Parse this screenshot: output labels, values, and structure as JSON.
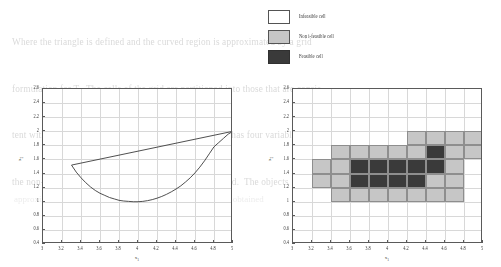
{
  "page": {
    "background_color": "#ffffff",
    "bleed_through_lines": [
      "Where the triangle is defined and the curved region is approximated by a grid",
      "formulation for T.  The cells of the grid are partitioned into those that are consis-",
      "tent with their neighbours in the radial scale.  The graph has four variables,",
      "the non-basic elements of the deformity region introduced.  The objects"
    ],
    "bleed_through_lower": "approximation cells and the feasible region of the relaxation obtained"
  },
  "legend": {
    "name": "cell-type-legend",
    "entries": [
      {
        "label": "Infeasible cell",
        "swatch_color": "#ffffff",
        "border_color": "#545454"
      },
      {
        "label": "Non i-feasible cell",
        "swatch_color": "#c6c6c6",
        "border_color": "#545454"
      },
      {
        "label": "Feasible cell",
        "swatch_color": "#3a3a3a",
        "border_color": "#303030"
      }
    ]
  },
  "chart_data": [
    {
      "id": "left",
      "type": "line",
      "title": "",
      "xlabel": "x₁",
      "ylabel": "x₂",
      "xlim": [
        3,
        5
      ],
      "ylim": [
        0.4,
        2.6
      ],
      "xticks": [
        "3",
        "3.2",
        "3.4",
        "3.6",
        "3.8",
        "4",
        "4.2",
        "4.4",
        "4.6",
        "4.8",
        "5"
      ],
      "xtick_values": [
        3,
        3.2,
        3.4,
        3.6,
        3.8,
        4,
        4.2,
        4.4,
        4.6,
        4.8,
        5
      ],
      "yticks": [
        "0.4",
        "0.6",
        "0.8",
        "1",
        "1.2",
        "1.4",
        "1.6",
        "1.8",
        "2",
        "2.2",
        "2.4",
        "2.6"
      ],
      "ytick_values": [
        0.4,
        0.6,
        0.8,
        1,
        1.2,
        1.4,
        1.6,
        1.8,
        2,
        2.2,
        2.4,
        2.6
      ],
      "grid": true,
      "legend_position": "none",
      "series": [
        {
          "name": "upper chord",
          "color": "#3c3c3c",
          "points": [
            [
              3.3,
              1.52
            ],
            [
              5.0,
              2.0
            ]
          ]
        },
        {
          "name": "lower parabola",
          "color": "#3c3c3c",
          "points": [
            [
              3.3,
              1.52
            ],
            [
              3.35,
              1.42
            ],
            [
              3.4,
              1.34
            ],
            [
              3.45,
              1.27
            ],
            [
              3.5,
              1.21
            ],
            [
              3.55,
              1.16
            ],
            [
              3.6,
              1.12
            ],
            [
              3.65,
              1.09
            ],
            [
              3.7,
              1.06
            ],
            [
              3.75,
              1.04
            ],
            [
              3.8,
              1.02
            ],
            [
              3.85,
              1.01
            ],
            [
              3.9,
              1.005
            ],
            [
              3.95,
              1.0
            ],
            [
              4.0,
              1.0
            ],
            [
              4.05,
              1.005
            ],
            [
              4.1,
              1.015
            ],
            [
              4.15,
              1.03
            ],
            [
              4.2,
              1.05
            ],
            [
              4.25,
              1.075
            ],
            [
              4.3,
              1.105
            ],
            [
              4.35,
              1.14
            ],
            [
              4.4,
              1.18
            ],
            [
              4.45,
              1.225
            ],
            [
              4.5,
              1.28
            ],
            [
              4.55,
              1.34
            ],
            [
              4.6,
              1.41
            ],
            [
              4.65,
              1.49
            ],
            [
              4.7,
              1.58
            ],
            [
              4.75,
              1.68
            ],
            [
              4.8,
              1.78
            ],
            [
              4.85,
              1.84
            ],
            [
              4.9,
              1.9
            ],
            [
              4.95,
              1.96
            ],
            [
              5.0,
              2.0
            ]
          ]
        }
      ]
    },
    {
      "id": "right",
      "type": "heatmap",
      "title": "",
      "xlabel": "x₁",
      "ylabel": "x₂",
      "xlim": [
        3,
        5
      ],
      "ylim": [
        0.4,
        2.6
      ],
      "xticks": [
        "3",
        "3.2",
        "3.4",
        "3.6",
        "3.8",
        "4",
        "4.2",
        "4.4",
        "4.6",
        "4.8",
        "5"
      ],
      "xtick_values": [
        3,
        3.2,
        3.4,
        3.6,
        3.8,
        4,
        4.2,
        4.4,
        4.6,
        4.8,
        5
      ],
      "yticks": [
        "0.4",
        "0.6",
        "0.8",
        "1",
        "1.2",
        "1.4",
        "1.6",
        "1.8",
        "2",
        "2.2",
        "2.4",
        "2.6"
      ],
      "ytick_values": [
        0.4,
        0.6,
        0.8,
        1,
        1.2,
        1.4,
        1.6,
        1.8,
        2,
        2.2,
        2.4,
        2.6
      ],
      "grid": true,
      "legend_position": "above",
      "cell_size": [
        0.2,
        0.2
      ],
      "colors": {
        "infeasible": "#ffffff",
        "non_i_feasible": "#c6c6c6",
        "feasible": "#3a3a3a"
      },
      "cells": [
        {
          "x": 4.2,
          "y": 1.8,
          "state": "non_i_feasible"
        },
        {
          "x": 4.4,
          "y": 1.8,
          "state": "non_i_feasible"
        },
        {
          "x": 4.6,
          "y": 1.8,
          "state": "non_i_feasible"
        },
        {
          "x": 4.8,
          "y": 1.8,
          "state": "non_i_feasible"
        },
        {
          "x": 3.4,
          "y": 1.6,
          "state": "non_i_feasible"
        },
        {
          "x": 3.6,
          "y": 1.6,
          "state": "non_i_feasible"
        },
        {
          "x": 3.8,
          "y": 1.6,
          "state": "non_i_feasible"
        },
        {
          "x": 4.0,
          "y": 1.6,
          "state": "non_i_feasible"
        },
        {
          "x": 4.2,
          "y": 1.6,
          "state": "non_i_feasible"
        },
        {
          "x": 4.4,
          "y": 1.6,
          "state": "feasible"
        },
        {
          "x": 4.6,
          "y": 1.6,
          "state": "non_i_feasible"
        },
        {
          "x": 4.8,
          "y": 1.6,
          "state": "non_i_feasible"
        },
        {
          "x": 3.2,
          "y": 1.4,
          "state": "non_i_feasible"
        },
        {
          "x": 3.4,
          "y": 1.4,
          "state": "non_i_feasible"
        },
        {
          "x": 3.6,
          "y": 1.4,
          "state": "feasible"
        },
        {
          "x": 3.8,
          "y": 1.4,
          "state": "feasible"
        },
        {
          "x": 4.0,
          "y": 1.4,
          "state": "feasible"
        },
        {
          "x": 4.2,
          "y": 1.4,
          "state": "feasible"
        },
        {
          "x": 4.4,
          "y": 1.4,
          "state": "feasible"
        },
        {
          "x": 4.6,
          "y": 1.4,
          "state": "non_i_feasible"
        },
        {
          "x": 4.8,
          "y": 1.4,
          "state": "infeasible"
        },
        {
          "x": 3.2,
          "y": 1.2,
          "state": "non_i_feasible"
        },
        {
          "x": 3.4,
          "y": 1.2,
          "state": "non_i_feasible"
        },
        {
          "x": 3.6,
          "y": 1.2,
          "state": "feasible"
        },
        {
          "x": 3.8,
          "y": 1.2,
          "state": "feasible"
        },
        {
          "x": 4.0,
          "y": 1.2,
          "state": "feasible"
        },
        {
          "x": 4.2,
          "y": 1.2,
          "state": "feasible"
        },
        {
          "x": 4.4,
          "y": 1.2,
          "state": "non_i_feasible"
        },
        {
          "x": 4.6,
          "y": 1.2,
          "state": "non_i_feasible"
        },
        {
          "x": 4.8,
          "y": 1.2,
          "state": "infeasible"
        },
        {
          "x": 3.4,
          "y": 1.0,
          "state": "non_i_feasible"
        },
        {
          "x": 3.6,
          "y": 1.0,
          "state": "non_i_feasible"
        },
        {
          "x": 3.8,
          "y": 1.0,
          "state": "non_i_feasible"
        },
        {
          "x": 4.0,
          "y": 1.0,
          "state": "non_i_feasible"
        },
        {
          "x": 4.2,
          "y": 1.0,
          "state": "non_i_feasible"
        },
        {
          "x": 4.4,
          "y": 1.0,
          "state": "non_i_feasible"
        },
        {
          "x": 4.6,
          "y": 1.0,
          "state": "non_i_feasible"
        }
      ]
    }
  ]
}
